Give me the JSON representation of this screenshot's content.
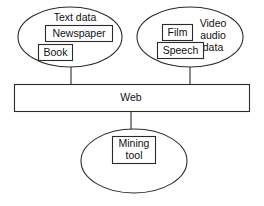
{
  "diagram": {
    "colors": {
      "stroke": "#2b2b2b",
      "fill": "#ffffff",
      "text": "#111111"
    },
    "nodes": {
      "text_data_group": {
        "label": "Text data",
        "shape": "ellipse",
        "items": [
          {
            "label": "Newspaper",
            "shape": "rect"
          },
          {
            "label": "Book",
            "shape": "rect"
          }
        ]
      },
      "video_audio_group": {
        "label_line1": "Video",
        "label_line2": "audio",
        "label_line3": "data",
        "shape": "ellipse",
        "items": [
          {
            "label": "Film",
            "shape": "rect"
          },
          {
            "label": "Speech",
            "shape": "rect"
          }
        ]
      },
      "web_bar": {
        "label": "Web",
        "shape": "rect"
      },
      "mining_group": {
        "shape": "ellipse",
        "items": [
          {
            "label_line1": "Mining",
            "label_line2": "tool",
            "shape": "rect"
          }
        ]
      }
    },
    "connectors": [
      {
        "from": "text_data_group",
        "to": "web_bar"
      },
      {
        "from": "video_audio_group",
        "to": "web_bar"
      },
      {
        "from": "web_bar",
        "to": "mining_group"
      }
    ]
  }
}
